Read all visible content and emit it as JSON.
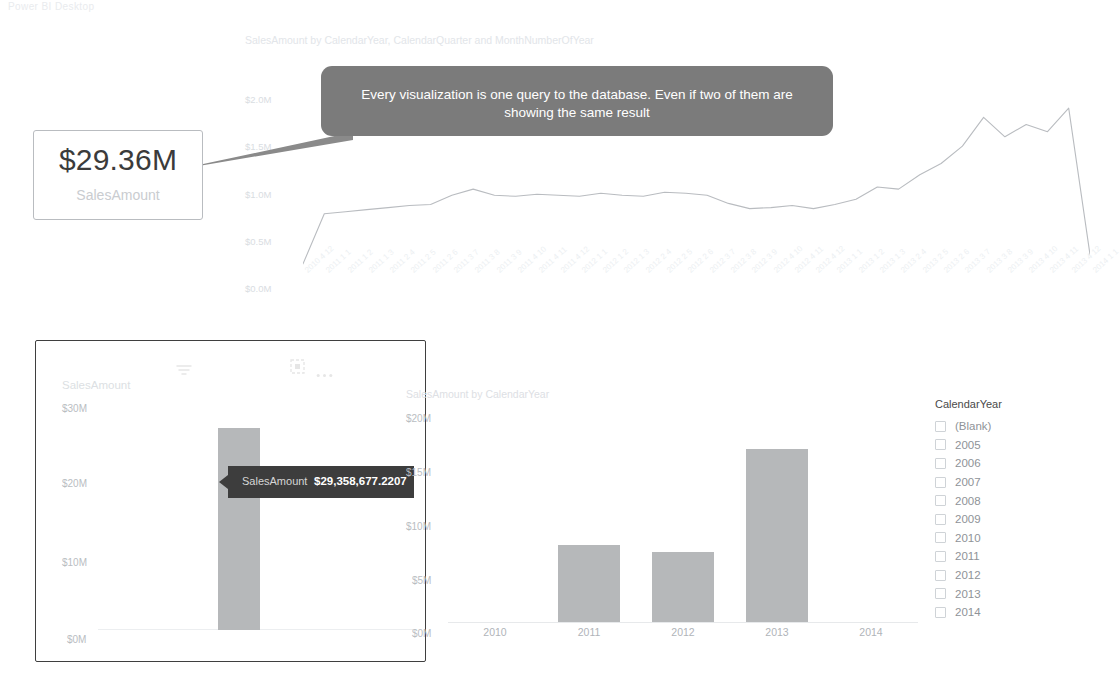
{
  "top_strip_text": "Power BI Desktop",
  "callout": {
    "text": "Every visualization is one query to the database. Even if two of them are showing the same result",
    "bg_color": "#7b7b7b",
    "text_color": "#ffffff"
  },
  "card_visual": {
    "value": "$29.36M",
    "label": "SalesAmount"
  },
  "line_visual": {
    "title": "SalesAmount by CalendarYear, CalendarQuarter and MonthNumberOfYear",
    "y_ticks": [
      "$2.0M",
      "$1.5M",
      "$1.0M",
      "$0.5M",
      "$0.0M"
    ]
  },
  "left_visual": {
    "title": "SalesAmount",
    "y_ticks": [
      "$30M",
      "$20M",
      "$10M",
      "$0M"
    ],
    "header_icons": [
      "filter-icon",
      "focus-mode-icon",
      "more-options-icon"
    ],
    "tooltip": {
      "label": "SalesAmount",
      "value": "$29,358,677.2207"
    }
  },
  "column_visual": {
    "title": "SalesAmount by CalendarYear",
    "y_ticks": [
      "$20M",
      "$15M",
      "$10M",
      "$5M",
      "$0M"
    ]
  },
  "slicer": {
    "title": "CalendarYear",
    "items": [
      {
        "label": "(Blank)",
        "checked": false
      },
      {
        "label": "2005",
        "checked": false
      },
      {
        "label": "2006",
        "checked": false
      },
      {
        "label": "2007",
        "checked": false
      },
      {
        "label": "2008",
        "checked": false
      },
      {
        "label": "2009",
        "checked": false
      },
      {
        "label": "2010",
        "checked": false
      },
      {
        "label": "2011",
        "checked": false
      },
      {
        "label": "2012",
        "checked": false
      },
      {
        "label": "2013",
        "checked": false
      },
      {
        "label": "2014",
        "checked": false
      }
    ]
  },
  "chart_data": [
    {
      "type": "line",
      "id": "sales-by-year-quarter-month",
      "title": "SalesAmount by CalendarYear, CalendarQuarter and MonthNumberOfYear",
      "xlabel": "",
      "ylabel": "",
      "ylim": [
        0,
        2000000
      ],
      "y_tick_values": [
        0,
        500000,
        1000000,
        1500000,
        2000000
      ],
      "y_tick_labels": [
        "$0.0M",
        "$0.5M",
        "$1.0M",
        "$1.5M",
        "$2.0M"
      ],
      "grid": false,
      "legend": "none",
      "line_color": "#b9bcc0",
      "categories": [
        "2010 4 12",
        "2011 1 1",
        "2011 1 2",
        "2011 1 3",
        "2011 2 4",
        "2011 2 5",
        "2011 2 6",
        "2011 3 7",
        "2011 3 8",
        "2011 3 9",
        "2011 4 10",
        "2011 4 11",
        "2011 4 12",
        "2012 1 1",
        "2012 1 2",
        "2012 1 3",
        "2012 2 4",
        "2012 2 5",
        "2012 2 6",
        "2012 3 7",
        "2012 3 8",
        "2012 3 9",
        "2012 4 10",
        "2012 4 11",
        "2012 4 12",
        "2013 1 1",
        "2013 1 2",
        "2013 1 3",
        "2013 2 4",
        "2013 2 5",
        "2013 2 6",
        "2013 3 7",
        "2013 3 8",
        "2013 3 9",
        "2013 4 10",
        "2013 4 11",
        "2013 4 12",
        "2014 1 1"
      ],
      "values": [
        30000,
        520000,
        540000,
        560000,
        580000,
        600000,
        610000,
        700000,
        760000,
        700000,
        690000,
        710000,
        700000,
        690000,
        720000,
        700000,
        690000,
        730000,
        720000,
        700000,
        620000,
        570000,
        580000,
        600000,
        570000,
        610000,
        660000,
        780000,
        760000,
        900000,
        1010000,
        1180000,
        1460000,
        1270000,
        1390000,
        1320000,
        1550000,
        120000
      ]
    },
    {
      "type": "bar",
      "id": "sales-amount-total",
      "title": "SalesAmount",
      "xlabel": "",
      "ylabel": "",
      "ylim": [
        0,
        32000000
      ],
      "y_tick_values": [
        0,
        10000000,
        20000000,
        30000000
      ],
      "y_tick_labels": [
        "$0M",
        "$10M",
        "$20M",
        "$30M"
      ],
      "categories": [
        "Total"
      ],
      "values": [
        29358677.2207
      ],
      "bar_color": "#b6b8ba",
      "grid": false,
      "legend": "none"
    },
    {
      "type": "bar",
      "id": "sales-by-calendar-year",
      "title": "SalesAmount by CalendarYear",
      "xlabel": "",
      "ylabel": "",
      "ylim": [
        0,
        20000000
      ],
      "y_tick_values": [
        0,
        5000000,
        10000000,
        15000000,
        20000000
      ],
      "y_tick_labels": [
        "$0M",
        "$5M",
        "$10M",
        "$15M",
        "$20M"
      ],
      "categories": [
        "2010",
        "2011",
        "2012",
        "2013",
        "2014"
      ],
      "values": [
        0,
        7100000,
        6400000,
        15900000,
        0
      ],
      "bar_color": "#b6b8ba",
      "grid": false,
      "legend": "none"
    }
  ]
}
